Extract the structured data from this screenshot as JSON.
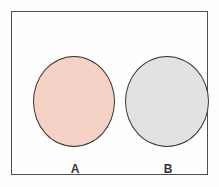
{
  "diagram": {
    "type": "venn-disjoint",
    "title": "",
    "frame": {
      "border_color": "#4e4e4e",
      "background_color": "#fefefe"
    },
    "sets": [
      {
        "id": "a",
        "label": "A",
        "fill_color": "#f6d1c6",
        "outline_color": "#3c3634",
        "shape": "circle"
      },
      {
        "id": "b",
        "label": "B",
        "fill_color": "#e2e2e2",
        "outline_color": "#3a3a3a",
        "shape": "circle"
      }
    ],
    "overlap": "none"
  }
}
